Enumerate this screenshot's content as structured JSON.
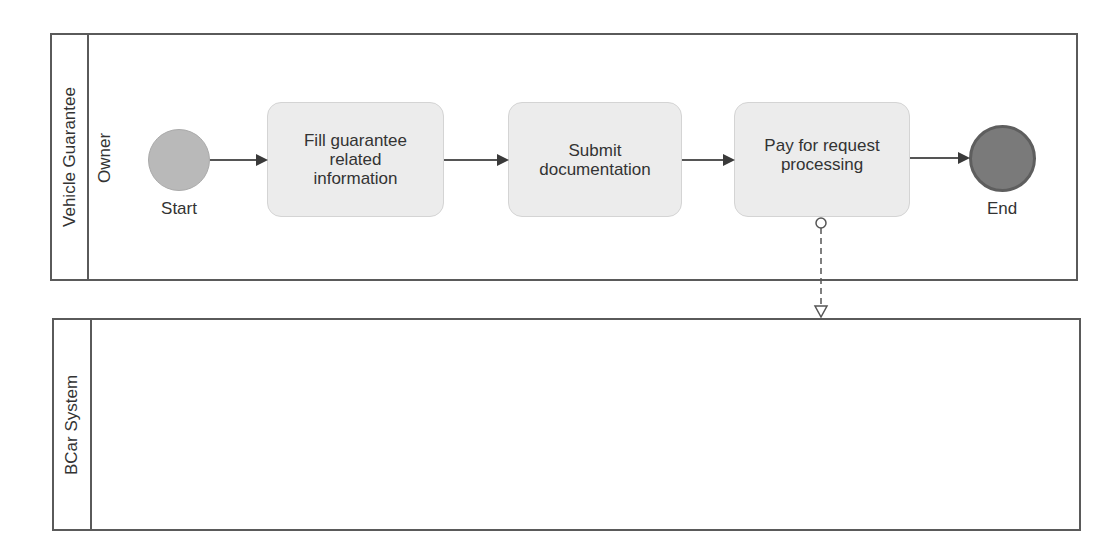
{
  "pools": [
    {
      "name": "Vehicle Guarantee",
      "lanes": [
        {
          "name": "Owner"
        }
      ]
    },
    {
      "name": "BCar System",
      "lanes": []
    }
  ],
  "events": {
    "start": {
      "label": "Start",
      "fill": "#b9b9b9",
      "stroke": "#aaaaaa"
    },
    "end": {
      "label": "End",
      "fill": "#7a7a7a",
      "stroke": "#5e5e5e"
    }
  },
  "tasks": [
    {
      "id": "t1",
      "label": "Fill guarantee related information"
    },
    {
      "id": "t2",
      "label": "Submit documentation"
    },
    {
      "id": "t3",
      "label": "Pay for request processing"
    }
  ],
  "flows": {
    "sequence": [
      {
        "from": "start",
        "to": "t1"
      },
      {
        "from": "t1",
        "to": "t2"
      },
      {
        "from": "t2",
        "to": "t3"
      },
      {
        "from": "t3",
        "to": "end"
      }
    ],
    "message": [
      {
        "from": "t3",
        "to": "BCar System"
      }
    ]
  },
  "colors": {
    "border": "#5a5a5a",
    "task_fill": "#ececec",
    "arrow": "#3a3a3a"
  }
}
